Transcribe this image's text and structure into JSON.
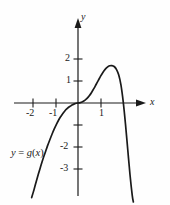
{
  "figure": {
    "background_color": "#fefefe",
    "ink_color": "#1a1a1a",
    "axis_label_x": "x",
    "axis_label_y": "y",
    "curve_label": "y = g(x)",
    "curve_label_parts": {
      "y": "y",
      "equals": " = ",
      "g": "g",
      "paren_open": "(",
      "x": "x",
      "paren_close": ")"
    }
  },
  "chart_data": {
    "type": "line",
    "title": "",
    "subtitle": "",
    "xlabel": "x",
    "ylabel": "y",
    "legend": [
      "y = g(x)"
    ],
    "legend_position": "lower-left",
    "grid": false,
    "xlim": [
      -3.4,
      3.7
    ],
    "ylim": [
      -4.3,
      2.8
    ],
    "xticks": [
      -2,
      -1,
      1
    ],
    "xtick_labels": [
      "-2",
      "-1",
      "1"
    ],
    "yticks": [
      2,
      1,
      -1,
      -2,
      -3
    ],
    "ytick_labels": [
      "2",
      "1",
      "",
      "-2",
      "-3"
    ],
    "annotations": [
      {
        "text": "y = g(x)",
        "x": -2.6,
        "y": -2.05
      }
    ],
    "features": {
      "inflection_at_origin": [
        0,
        0
      ],
      "local_maximum": [
        1.6,
        1.7
      ],
      "right_x_intercept": [
        2.0,
        0
      ],
      "left_branch_direction": "descends to minus infinity",
      "right_branch_direction": "descends to minus infinity"
    },
    "series": [
      {
        "name": "y = g(x)",
        "x": [
          -2.05,
          -1.95,
          -1.85,
          -1.75,
          -1.65,
          -1.55,
          -1.45,
          -1.35,
          -1.25,
          -1.15,
          -1.05,
          -0.95,
          -0.85,
          -0.78,
          -0.7,
          -0.62,
          -0.55,
          -0.48,
          -0.4,
          -0.32,
          -0.24,
          -0.16,
          -0.08,
          0.0,
          0.1,
          0.2,
          0.3,
          0.4,
          0.5,
          0.6,
          0.7,
          0.8,
          0.9,
          1.0,
          1.1,
          1.2,
          1.3,
          1.4,
          1.5,
          1.6,
          1.7,
          1.8,
          1.9,
          2.0,
          2.1,
          2.2,
          2.3,
          2.4,
          2.45
        ],
        "y": [
          -4.3,
          -3.95,
          -3.58,
          -3.22,
          -2.88,
          -2.55,
          -2.25,
          -1.95,
          -1.68,
          -1.42,
          -1.18,
          -0.96,
          -0.76,
          -0.64,
          -0.52,
          -0.41,
          -0.32,
          -0.25,
          -0.18,
          -0.13,
          -0.08,
          -0.04,
          -0.01,
          0.0,
          0.02,
          0.06,
          0.12,
          0.21,
          0.33,
          0.48,
          0.65,
          0.84,
          1.03,
          1.22,
          1.39,
          1.53,
          1.63,
          1.69,
          1.7,
          1.66,
          1.53,
          1.28,
          0.82,
          0.06,
          -0.95,
          -2.1,
          -3.25,
          -4.2,
          -4.5
        ]
      }
    ]
  }
}
